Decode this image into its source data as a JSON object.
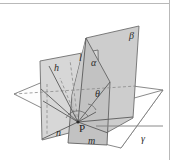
{
  "figure": {
    "width": 174,
    "height": 160,
    "background": "#ffffff",
    "frame": {
      "top_rule_color": "#b9b9b9",
      "right_rule_color": "#b9b9b9"
    },
    "colors": {
      "plane_fill_beta": "#cfcfcf",
      "plane_fill_alpha": "#c4c4c4",
      "plane_fill_left": "#d6d6d6",
      "plane_fill_gamma": "#ffffff",
      "plane_fill_base": "#fdfdfd",
      "stroke": "#6b6b6b",
      "stroke_dark": "#4a4a4a",
      "dashed": "#8a8a8a",
      "label": "#2a2a2a"
    },
    "labels": [
      {
        "id": "beta",
        "text": "β",
        "x": 129,
        "y": 39,
        "size": 10,
        "italic": true,
        "name": "plane-label-beta"
      },
      {
        "id": "alpha",
        "text": "α",
        "x": 91,
        "y": 66,
        "size": 10,
        "italic": true,
        "name": "plane-label-alpha"
      },
      {
        "id": "gamma",
        "text": "γ",
        "x": 141,
        "y": 142,
        "size": 10,
        "italic": true,
        "name": "plane-label-gamma"
      },
      {
        "id": "l",
        "text": "l",
        "x": 79,
        "y": 61,
        "size": 10,
        "italic": true,
        "name": "line-label-l"
      },
      {
        "id": "h",
        "text": "h",
        "x": 54,
        "y": 71,
        "size": 10,
        "italic": true,
        "name": "line-label-h"
      },
      {
        "id": "theta",
        "text": "θ",
        "x": 95,
        "y": 97,
        "size": 10,
        "italic": true,
        "name": "angle-label-theta"
      },
      {
        "id": "n",
        "text": "n",
        "x": 56,
        "y": 136,
        "size": 10,
        "italic": true,
        "name": "line-label-n"
      },
      {
        "id": "m",
        "text": "m",
        "x": 88,
        "y": 144,
        "size": 10,
        "italic": true,
        "name": "line-label-m"
      },
      {
        "id": "P",
        "text": "P",
        "x": 79,
        "y": 132,
        "size": 11,
        "italic": false,
        "name": "point-label-p"
      }
    ],
    "points": {
      "P": {
        "x": 78,
        "y": 122
      },
      "apex": {
        "x": 86,
        "y": 38
      }
    },
    "geometry_notes": {
      "planes": [
        "alpha",
        "beta",
        "gamma"
      ],
      "lines": [
        "h",
        "l",
        "m",
        "n"
      ],
      "angle": "theta",
      "vertex": "P"
    }
  }
}
